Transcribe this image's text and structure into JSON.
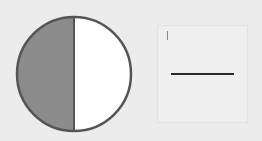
{
  "diagram": {
    "type": "fraction-circle",
    "parts_total": 2,
    "parts_shaded": 1,
    "shaded_side": "left",
    "colors": {
      "shaded": "#8c8c8c",
      "unshaded": "#ffffff",
      "outline": "#555555",
      "background": "#ececec"
    }
  },
  "answer": {
    "numerator": "",
    "denominator": ""
  }
}
